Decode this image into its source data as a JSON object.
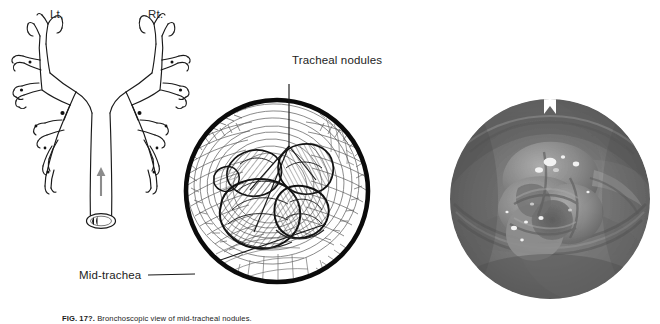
{
  "figure": {
    "panels": {
      "tree": {
        "name": "tracheobronchial-tree-diagram",
        "side_labels": {
          "left": "Lt.",
          "right": "Rt."
        },
        "arrow": "upward-view-direction-arrow",
        "lumen_marker": "tracheal-lumen-oval"
      },
      "drawing": {
        "name": "endoscopic-line-drawing",
        "shape": "circle",
        "depicts": "tracheal lumen with three rounded nodules on anterior wall"
      },
      "photo": {
        "name": "endoscopic-photograph",
        "shape": "circle",
        "depicts": "bronchoscopic view of mid-tracheal nodules"
      }
    },
    "callouts": [
      {
        "id": "tracheal-nodules",
        "text": "Tracheal nodules",
        "leaders": 3
      },
      {
        "id": "mid-trachea",
        "text": "Mid-trachea",
        "leaders": 1
      }
    ],
    "caption": {
      "number": "FIG. 17?.",
      "text": "Bronchoscopic view of mid-tracheal nodules."
    },
    "colors": {
      "ink": "#111111",
      "label_text": "#1c1c1c",
      "arrow_gray": "#8c8c8c",
      "photo_dark": "#4a4a4a",
      "photo_mid": "#8d8d8d",
      "photo_light": "#bdbdbd",
      "background": "#ffffff"
    }
  }
}
